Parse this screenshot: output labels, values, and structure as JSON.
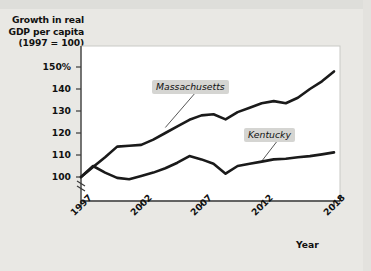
{
  "figure": {
    "title_lines": [
      "Growth in real",
      "GDP per capita",
      "(1997 = 100)"
    ],
    "background_color": "#e9e8e4",
    "plot_background_color": "#ffffff",
    "line_color": "#1a1a1a",
    "callout_background_color": "#d5d5d2"
  },
  "chart_data": {
    "type": "line",
    "title": "Growth in real GDP per capita (1997 = 100)",
    "xlabel": "Year",
    "ylabel": "Growth in real GDP per capita (1997 = 100)",
    "grid": false,
    "legend_position": "inline-callout",
    "axis_break_below_100": true,
    "xlim": [
      1997,
      2018
    ],
    "ylim": [
      100,
      150
    ],
    "ytick_labels": [
      "100",
      "110",
      "120",
      "130",
      "140",
      "150%"
    ],
    "ytick_values": [
      100,
      110,
      120,
      130,
      140,
      150
    ],
    "xtick_labels": [
      "1997",
      "2002",
      "2007",
      "2012",
      "2018"
    ],
    "xtick_values": [
      1997,
      2002,
      2007,
      2012,
      2018
    ],
    "x": [
      1997,
      1998,
      1999,
      2000,
      2001,
      2002,
      2003,
      2004,
      2005,
      2006,
      2007,
      2008,
      2009,
      2010,
      2011,
      2012,
      2013,
      2014,
      2015,
      2016,
      2017,
      2018
    ],
    "series": [
      {
        "name": "Massachusetts",
        "values": [
          100.0,
          104.5,
          109.0,
          113.8,
          114.2,
          114.6,
          117.0,
          120.0,
          123.0,
          126.0,
          128.0,
          128.5,
          126.2,
          129.5,
          131.5,
          133.5,
          134.5,
          133.5,
          136.0,
          140.0,
          143.5,
          148.0
        ]
      },
      {
        "name": "Kentucky",
        "values": [
          100.0,
          105.0,
          102.0,
          99.6,
          99.0,
          100.5,
          102.0,
          104.0,
          106.5,
          109.5,
          108.0,
          106.0,
          101.5,
          105.0,
          106.0,
          107.0,
          108.0,
          108.3,
          109.0,
          109.5,
          110.3,
          111.2
        ]
      }
    ],
    "callouts": [
      {
        "label": "Massachusetts",
        "points_to_year": 2004,
        "points_to_value": 122.5
      },
      {
        "label": "Kentucky",
        "points_to_year": 2012,
        "points_to_value": 107.2
      }
    ]
  }
}
